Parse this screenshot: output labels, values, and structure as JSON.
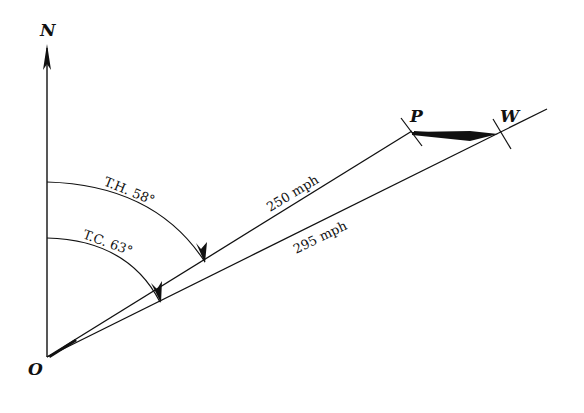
{
  "diagram": {
    "type": "vector-navigation",
    "points": {
      "origin": "O",
      "north": "N",
      "heading_end": "P",
      "wind_end": "W"
    },
    "angles": {
      "true_heading": "T.H. 58°",
      "true_course": "T.C. 63°"
    },
    "speeds": {
      "airspeed": "250 mph",
      "groundspeed": "295 mph"
    },
    "colors": {
      "line": "#111111",
      "background": "#ffffff"
    }
  }
}
